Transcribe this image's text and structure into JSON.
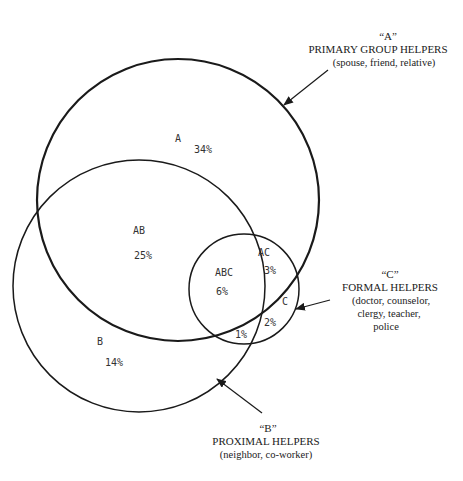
{
  "diagram": {
    "type": "venn",
    "sets": [
      {
        "id": "A",
        "quote_label": "“A”",
        "title": "PRIMARY GROUP HELPERS",
        "examples": "(spouse, friend, relative)"
      },
      {
        "id": "B",
        "quote_label": "“B”",
        "title": "PROXIMAL HELPERS",
        "examples": "(neighbor, co-worker)"
      },
      {
        "id": "C",
        "quote_label": "“C”",
        "title": "FORMAL HELPERS",
        "examples_lines": [
          "(doctor, counselor,",
          "clergy, teacher,",
          "police"
        ]
      }
    ],
    "regions": {
      "A": {
        "label": "A",
        "value": "34%"
      },
      "AB": {
        "label": "AB",
        "value": "25%"
      },
      "B": {
        "label": "B",
        "value": "14%"
      },
      "ABC": {
        "label": "ABC",
        "value": "6%"
      },
      "AC": {
        "label": "AC",
        "value": "3%"
      },
      "C": {
        "label": "C",
        "value": "2%"
      },
      "BC": {
        "label": "",
        "value": "1%"
      }
    },
    "colors": {
      "stroke": "#1a1a1a",
      "background": "#ffffff"
    }
  }
}
